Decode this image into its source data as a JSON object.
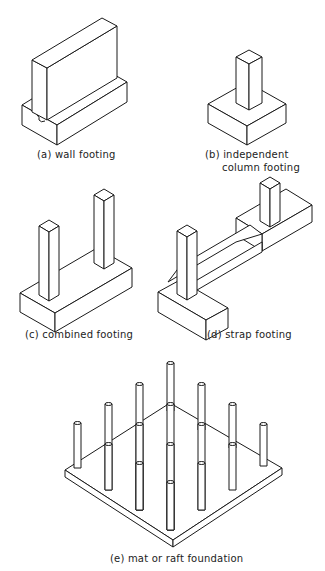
{
  "figure": {
    "panels": [
      {
        "id": "a",
        "label": "(a) wall footing"
      },
      {
        "id": "b",
        "label_line1": "(b) independent",
        "label_line2": "column footing"
      },
      {
        "id": "c",
        "label": "(c) combined footing"
      },
      {
        "id": "d",
        "label": "(d) strap footing"
      },
      {
        "id": "e",
        "label": "(e) mat or raft  foundation"
      }
    ],
    "colors": {
      "line": "#1a1a1a",
      "background": "#ffffff"
    }
  }
}
